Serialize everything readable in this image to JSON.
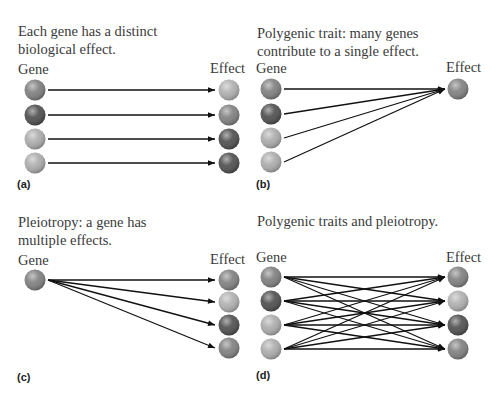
{
  "panels": [
    {
      "id": "a",
      "label": "(a)",
      "caption_lines": [
        "Each gene has a distinct",
        "biological effect."
      ],
      "gene_header": "Gene",
      "effect_header": "Effect",
      "genes": [
        "#7f7f7f",
        "#4e4e4e",
        "#acacac",
        "#acacac"
      ],
      "effects": [
        "#b0b0b0",
        "#808080",
        "#4f4f4f",
        "#4f4f4f"
      ],
      "connections": [
        [
          0,
          0
        ],
        [
          1,
          1
        ],
        [
          2,
          2
        ],
        [
          3,
          3
        ]
      ]
    },
    {
      "id": "b",
      "label": "(b)",
      "caption_lines": [
        "Polygenic trait: many genes",
        "contribute to a single effect."
      ],
      "gene_header": "Gene",
      "effect_header": "Effect",
      "genes": [
        "#7f7f7f",
        "#4e4e4e",
        "#acacac",
        "#acacac"
      ],
      "effects": [
        "#808080"
      ],
      "connections": [
        [
          0,
          0
        ],
        [
          1,
          0
        ],
        [
          2,
          0
        ],
        [
          3,
          0
        ]
      ]
    },
    {
      "id": "c",
      "label": "(c)",
      "caption_lines": [
        "Pleiotropy: a gene has",
        "multiple effects."
      ],
      "gene_header": "Gene",
      "effect_header": "Effect",
      "genes": [
        "#7f7f7f"
      ],
      "effects": [
        "#808080",
        "#b0b0b0",
        "#4f4f4f",
        "#808080"
      ],
      "connections": [
        [
          0,
          0
        ],
        [
          0,
          1
        ],
        [
          0,
          2
        ],
        [
          0,
          3
        ]
      ]
    },
    {
      "id": "d",
      "label": "(d)",
      "caption_lines": [
        "Polygenic traits and pleiotropy."
      ],
      "gene_header": "Gene",
      "effect_header": "Effect",
      "genes": [
        "#7f7f7f",
        "#4e4e4e",
        "#acacac",
        "#acacac"
      ],
      "effects": [
        "#808080",
        "#b0b0b0",
        "#4f4f4f",
        "#808080"
      ],
      "connections": "all-to-all"
    }
  ]
}
